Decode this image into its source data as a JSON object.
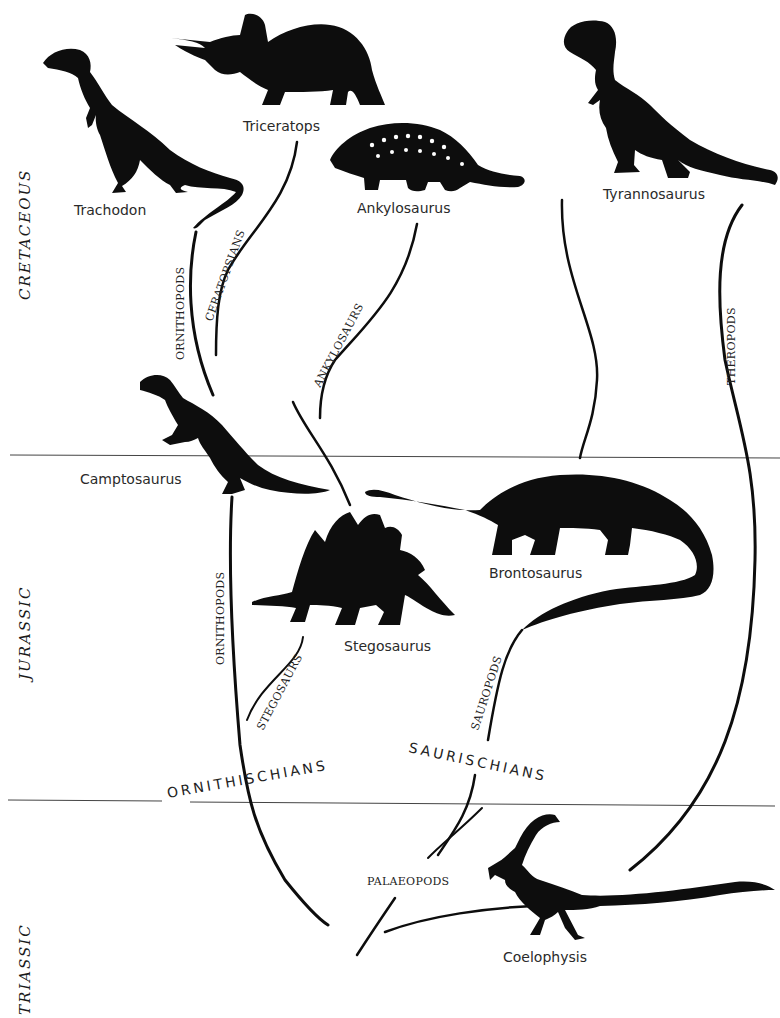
{
  "eras": [
    {
      "id": "cretaceous",
      "label": "CRETACEOUS"
    },
    {
      "id": "jurassic",
      "label": "JURASSIC"
    },
    {
      "id": "triassic",
      "label": "TRIASSIC"
    }
  ],
  "dinosaurs": [
    {
      "id": "trachodon",
      "label": "Trachodon",
      "era": "Cretaceous"
    },
    {
      "id": "triceratops",
      "label": "Triceratops",
      "era": "Cretaceous"
    },
    {
      "id": "ankylosaurus",
      "label": "Ankylosaurus",
      "era": "Cretaceous"
    },
    {
      "id": "tyrannosaurus",
      "label": "Tyrannosaurus",
      "era": "Cretaceous"
    },
    {
      "id": "camptosaurus",
      "label": "Camptosaurus",
      "era": "Jurassic"
    },
    {
      "id": "brontosaurus",
      "label": "Brontosaurus",
      "era": "Jurassic"
    },
    {
      "id": "stegosaurus",
      "label": "Stegosaurus",
      "era": "Jurassic"
    },
    {
      "id": "coelophysis",
      "label": "Coelophysis",
      "era": "Triassic"
    }
  ],
  "lineages": [
    {
      "id": "ornithopods_upper",
      "label": "ORNITHOPODS"
    },
    {
      "id": "ceratopsians",
      "label": "CERATOPSIANS"
    },
    {
      "id": "ankylosaurs",
      "label": "ANKYLOSAURS"
    },
    {
      "id": "theropods",
      "label": "THEROPODS"
    },
    {
      "id": "ornithopods_lower",
      "label": "ORNITHOPODS"
    },
    {
      "id": "stegosaurs",
      "label": "STEGOSAURS"
    },
    {
      "id": "sauropods",
      "label": "SAUROPODS"
    },
    {
      "id": "palaeopods",
      "label": "PALAEOPODS"
    }
  ],
  "orders": [
    {
      "id": "ornithischians",
      "label": "ORNITHISCHIANS"
    },
    {
      "id": "saurischians",
      "label": "SAURISCHIANS"
    }
  ],
  "colors": {
    "ink": "#0d0d0d",
    "paper": "#ffffff",
    "divider": "#444444"
  }
}
